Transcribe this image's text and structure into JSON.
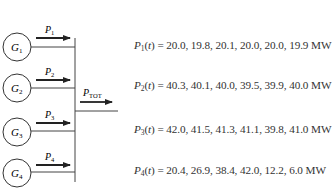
{
  "diagram": {
    "generators": [
      {
        "label": "G",
        "sub": "1",
        "power_label": "P",
        "power_sub": "1"
      },
      {
        "label": "G",
        "sub": "2",
        "power_label": "P",
        "power_sub": "2"
      },
      {
        "label": "G",
        "sub": "3",
        "power_label": "P",
        "power_sub": "3"
      },
      {
        "label": "G",
        "sub": "4",
        "power_label": "P",
        "power_sub": "4"
      }
    ],
    "output": {
      "label": "P",
      "sub": "TOT"
    }
  },
  "equations": [
    {
      "var": "P",
      "sub": "1",
      "arg": "(t)",
      "eq": " = ",
      "values": "20.0, 19.8, 20.1, 20.0, 20.0, 19.9",
      "unit": " MW"
    },
    {
      "var": "P",
      "sub": "2",
      "arg": "(t)",
      "eq": " = ",
      "values": "40.3, 40.1, 40.0, 39.5, 39.9, 40.0",
      "unit": " MW"
    },
    {
      "var": "P",
      "sub": "3",
      "arg": "(t)",
      "eq": " = ",
      "values": "42.0, 41.5, 41.3, 41.1, 39.8, 41.0",
      "unit": " MW"
    },
    {
      "var": "P",
      "sub": "4",
      "arg": "(t)",
      "eq": " = ",
      "values": "20.4, 26.9, 38.4, 42.0, 12.2, 6.0",
      "unit": " MW"
    }
  ]
}
